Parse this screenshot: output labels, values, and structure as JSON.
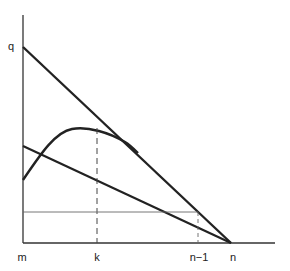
{
  "diagram": {
    "axis_labels": {
      "y_top": "q",
      "x_origin": "m",
      "x_k": "k",
      "x_n_minus_1": "n−1",
      "x_n": "n"
    },
    "elements": [
      {
        "type": "line",
        "name": "upper-line",
        "from": "q",
        "to": "n"
      },
      {
        "type": "line",
        "name": "lower-line",
        "from": "y-axis mid",
        "to": "n"
      },
      {
        "type": "curve",
        "name": "hump-curve",
        "description": "rises from y-axis, peaks near k, merges tangentially into upper line"
      },
      {
        "type": "dashed-line",
        "name": "k-guide",
        "at": "k"
      },
      {
        "type": "thin-line",
        "name": "horizontal-level",
        "from": "y-axis",
        "to": "n-1"
      },
      {
        "type": "dashed-line",
        "name": "n-1-guide",
        "at": "n-1"
      }
    ]
  }
}
